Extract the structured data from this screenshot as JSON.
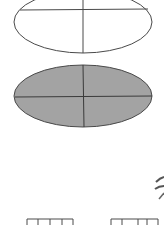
{
  "diagram": {
    "colors": {
      "stroke": "#4a4a4a",
      "fill_gray": "#a3a3a3",
      "background": "#ffffff"
    },
    "shapes": [
      {
        "id": "ellipse-outline",
        "type": "ellipse",
        "filled": false
      },
      {
        "id": "ellipse-filled",
        "type": "ellipse",
        "filled": true
      },
      {
        "id": "bracket-left",
        "type": "comb-bracket"
      },
      {
        "id": "bracket-right",
        "type": "comb-bracket"
      },
      {
        "id": "curve-fragment",
        "type": "partial-curve"
      }
    ]
  }
}
